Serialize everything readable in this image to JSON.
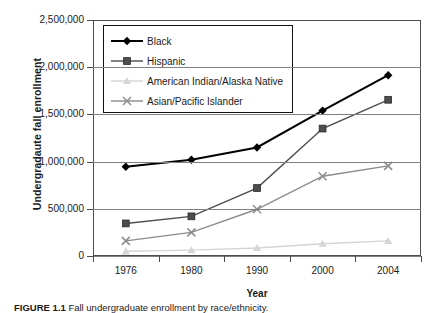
{
  "chart_data": {
    "type": "line",
    "title": "",
    "xlabel": "Year",
    "ylabel": "Undergradaute fall enrollment",
    "categories": [
      "1976",
      "1980",
      "1990",
      "2000",
      "2004"
    ],
    "ylim": [
      0,
      2500000
    ],
    "ytick_labels": [
      "0",
      "500,000",
      "1,000,000",
      "1,500,000",
      "2,000,000",
      "2,500,000"
    ],
    "ytick_values": [
      0,
      500000,
      1000000,
      1500000,
      2000000,
      2500000
    ],
    "grid": true,
    "legend_position": "upper-left-inside",
    "series": [
      {
        "name": "Black",
        "marker": "diamond",
        "color": "#000000",
        "values": [
          945000,
          1020000,
          1150000,
          1540000,
          1915000
        ]
      },
      {
        "name": "Hispanic",
        "marker": "square",
        "color": "#4d4d4d",
        "values": [
          345000,
          420000,
          720000,
          1350000,
          1655000
        ]
      },
      {
        "name": "American Indian/Alaska Native",
        "marker": "triangle",
        "color": "#d4d4d4",
        "values": [
          50000,
          62000,
          85000,
          130000,
          160000
        ]
      },
      {
        "name": "Asian/Pacific Islander",
        "marker": "x",
        "color": "#8c8c8c",
        "values": [
          160000,
          250000,
          495000,
          845000,
          955000
        ]
      }
    ]
  },
  "caption": {
    "label": "FIGURE 1.1",
    "text": "Fall undergraduate enrollment by race/ethnicity."
  }
}
